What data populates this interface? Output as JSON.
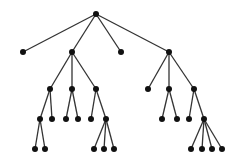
{
  "diagram": {
    "type": "tree",
    "edge_color": "#333333",
    "node_color": "#111111",
    "node_radius": 3,
    "nodes": [
      {
        "id": "n0",
        "x": 96,
        "y": 14
      },
      {
        "id": "n1",
        "x": 23,
        "y": 52,
        "parent": "n0"
      },
      {
        "id": "n2",
        "x": 72,
        "y": 52,
        "parent": "n0"
      },
      {
        "id": "n3",
        "x": 121,
        "y": 52,
        "parent": "n0"
      },
      {
        "id": "n4",
        "x": 169,
        "y": 52,
        "parent": "n0"
      },
      {
        "id": "n5",
        "x": 50,
        "y": 89,
        "parent": "n2"
      },
      {
        "id": "n6",
        "x": 72,
        "y": 89,
        "parent": "n2"
      },
      {
        "id": "n7",
        "x": 96,
        "y": 89,
        "parent": "n2"
      },
      {
        "id": "n8",
        "x": 40,
        "y": 119,
        "parent": "n5"
      },
      {
        "id": "n9",
        "x": 52,
        "y": 119,
        "parent": "n5"
      },
      {
        "id": "n10",
        "x": 66,
        "y": 119,
        "parent": "n6"
      },
      {
        "id": "n11",
        "x": 78,
        "y": 119,
        "parent": "n6"
      },
      {
        "id": "n12",
        "x": 91,
        "y": 119,
        "parent": "n7"
      },
      {
        "id": "n13",
        "x": 106,
        "y": 119,
        "parent": "n7"
      },
      {
        "id": "n14",
        "x": 35,
        "y": 149,
        "parent": "n8"
      },
      {
        "id": "n15",
        "x": 45,
        "y": 149,
        "parent": "n8"
      },
      {
        "id": "n16",
        "x": 94,
        "y": 149,
        "parent": "n13"
      },
      {
        "id": "n17",
        "x": 104,
        "y": 149,
        "parent": "n13"
      },
      {
        "id": "n18",
        "x": 114,
        "y": 149,
        "parent": "n13"
      },
      {
        "id": "n19",
        "x": 148,
        "y": 89,
        "parent": "n4"
      },
      {
        "id": "n20",
        "x": 169,
        "y": 89,
        "parent": "n4"
      },
      {
        "id": "n21",
        "x": 194,
        "y": 89,
        "parent": "n4"
      },
      {
        "id": "n22",
        "x": 162,
        "y": 119,
        "parent": "n20"
      },
      {
        "id": "n23",
        "x": 177,
        "y": 119,
        "parent": "n20"
      },
      {
        "id": "n24",
        "x": 189,
        "y": 119,
        "parent": "n21"
      },
      {
        "id": "n25",
        "x": 204,
        "y": 119,
        "parent": "n21"
      },
      {
        "id": "n26",
        "x": 191,
        "y": 149,
        "parent": "n25"
      },
      {
        "id": "n27",
        "x": 202,
        "y": 149,
        "parent": "n25"
      },
      {
        "id": "n28",
        "x": 212,
        "y": 149,
        "parent": "n25"
      },
      {
        "id": "n29",
        "x": 222,
        "y": 149,
        "parent": "n25"
      }
    ]
  }
}
